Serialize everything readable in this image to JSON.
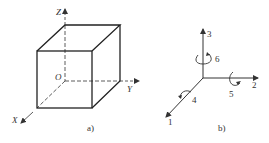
{
  "figure_a": {
    "caption": "a)",
    "axes": {
      "x": "X",
      "y": "Y",
      "z": "Z",
      "origin": "O"
    }
  },
  "figure_b": {
    "caption": "b)",
    "axis_labels": {
      "axis1": "1",
      "axis2": "2",
      "axis3": "3"
    },
    "rotation_labels": {
      "rot4": "4",
      "rot5": "5",
      "rot6": "6"
    }
  },
  "colors": {
    "line": "#333333",
    "background": "#ffffff"
  }
}
